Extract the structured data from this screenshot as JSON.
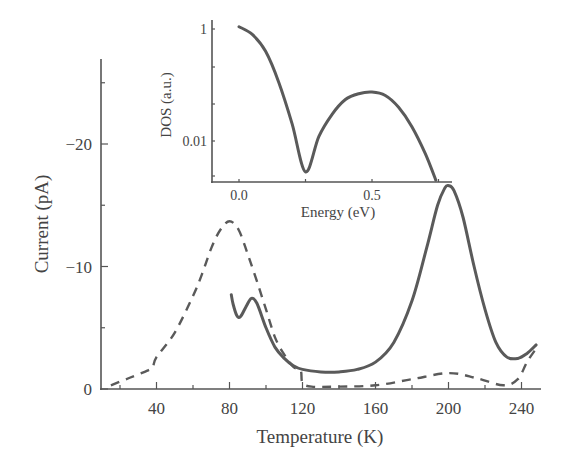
{
  "chart_data": [
    {
      "type": "line",
      "title": "",
      "xlabel": "Temperature (K)",
      "ylabel": "Current (pA)",
      "xlim": [
        10,
        251
      ],
      "ylim": [
        0,
        -27
      ],
      "xticks": [
        40,
        80,
        120,
        160,
        200,
        240
      ],
      "xtick_labels": [
        "40",
        "80",
        "120",
        "160",
        "200",
        "240"
      ],
      "yticks": [
        0,
        -10,
        -20
      ],
      "ytick_labels": [
        "0",
        "−10",
        "−20"
      ],
      "grid": false,
      "series": [
        {
          "name": "dashed",
          "style": "dashed",
          "points": [
            [
              15,
              -0.3
            ],
            [
              25,
              -0.9
            ],
            [
              35,
              -1.5
            ],
            [
              38,
              -1.8
            ],
            [
              40,
              -2.6
            ],
            [
              50,
              -4.6
            ],
            [
              60,
              -7.6
            ],
            [
              65,
              -9.4
            ],
            [
              70,
              -11.5
            ],
            [
              75,
              -13.0
            ],
            [
              80,
              -13.7
            ],
            [
              85,
              -13.0
            ],
            [
              90,
              -11.0
            ],
            [
              95,
              -8.8
            ],
            [
              100,
              -6.5
            ],
            [
              105,
              -4.2
            ],
            [
              110,
              -2.8
            ],
            [
              115,
              -1.8
            ],
            [
              119,
              -1.5
            ],
            [
              120,
              -0.5
            ],
            [
              125,
              -0.2
            ],
            [
              140,
              -0.2
            ],
            [
              160,
              -0.3
            ],
            [
              180,
              -0.8
            ],
            [
              200,
              -1.3
            ],
            [
              215,
              -0.9
            ],
            [
              230,
              -0.3
            ],
            [
              238,
              -0.8
            ],
            [
              243,
              -2.2
            ],
            [
              248,
              -3.3
            ]
          ]
        },
        {
          "name": "solid",
          "style": "solid",
          "points": [
            [
              81,
              -7.7
            ],
            [
              82,
              -6.9
            ],
            [
              84,
              -6.0
            ],
            [
              86,
              -5.9
            ],
            [
              89,
              -6.7
            ],
            [
              92,
              -7.4
            ],
            [
              95,
              -7.0
            ],
            [
              100,
              -5.0
            ],
            [
              105,
              -3.4
            ],
            [
              110,
              -2.5
            ],
            [
              115,
              -1.9
            ],
            [
              120,
              -1.6
            ],
            [
              130,
              -1.4
            ],
            [
              140,
              -1.4
            ],
            [
              150,
              -1.6
            ],
            [
              160,
              -2.2
            ],
            [
              170,
              -3.8
            ],
            [
              180,
              -7.2
            ],
            [
              188,
              -11.5
            ],
            [
              194,
              -15.0
            ],
            [
              198,
              -16.4
            ],
            [
              200,
              -16.6
            ],
            [
              203,
              -16.2
            ],
            [
              208,
              -14.0
            ],
            [
              214,
              -10.0
            ],
            [
              220,
              -6.5
            ],
            [
              226,
              -3.8
            ],
            [
              232,
              -2.6
            ],
            [
              238,
              -2.5
            ],
            [
              243,
              -2.9
            ],
            [
              248,
              -3.6
            ]
          ]
        }
      ]
    },
    {
      "type": "line",
      "title": "inset",
      "xlabel": "Energy (eV)",
      "ylabel": "DOS (a.u.)",
      "xlim": [
        -0.1,
        0.8
      ],
      "ylim": [
        0.0019,
        1.2
      ],
      "yscale": "log",
      "xticks": [
        0.0,
        0.5
      ],
      "xtick_labels": [
        "0.0",
        "0.5"
      ],
      "yticks": [
        1,
        0.01
      ],
      "ytick_labels": [
        "1",
        "0.01"
      ],
      "grid": false,
      "series": [
        {
          "name": "DOS",
          "style": "solid",
          "points": [
            [
              0.0,
              1.1
            ],
            [
              0.05,
              0.8
            ],
            [
              0.1,
              0.4
            ],
            [
              0.15,
              0.11
            ],
            [
              0.2,
              0.02
            ],
            [
              0.25,
              0.0028
            ],
            [
              0.3,
              0.012
            ],
            [
              0.35,
              0.03
            ],
            [
              0.4,
              0.055
            ],
            [
              0.45,
              0.07
            ],
            [
              0.5,
              0.075
            ],
            [
              0.55,
              0.065
            ],
            [
              0.6,
              0.04
            ],
            [
              0.65,
              0.018
            ],
            [
              0.7,
              0.006
            ],
            [
              0.74,
              0.002
            ]
          ]
        }
      ]
    }
  ]
}
